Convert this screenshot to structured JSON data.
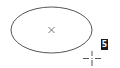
{
  "canvas": {
    "background": "#ffffff",
    "stroke_color": "#555555"
  },
  "shape": {
    "type": "ellipse",
    "center_marker": "x-mark-icon"
  },
  "cursor": {
    "type": "crosshair-cursor-icon"
  },
  "label": {
    "text": "5"
  }
}
